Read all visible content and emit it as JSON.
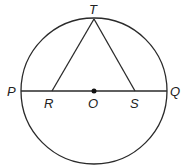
{
  "diagram": {
    "type": "geometry",
    "circle": {
      "center": "O",
      "cx": 94,
      "cy": 91,
      "r": 73
    },
    "points": {
      "T": {
        "label": "T",
        "x": 94,
        "y": 19
      },
      "P": {
        "label": "P",
        "x": 21,
        "y": 91
      },
      "Q": {
        "label": "Q",
        "x": 167,
        "y": 91
      },
      "R": {
        "label": "R",
        "x": 52,
        "y": 91
      },
      "O": {
        "label": "O",
        "x": 94,
        "y": 91
      },
      "S": {
        "label": "S",
        "x": 135,
        "y": 91
      }
    },
    "segments": [
      "PQ",
      "TR",
      "TS"
    ],
    "colors": {
      "stroke": "#2a2a2a",
      "background": "#ffffff"
    }
  }
}
